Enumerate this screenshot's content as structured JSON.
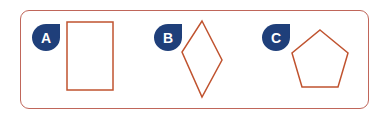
{
  "options": [
    {
      "label": "A",
      "shape": "rectangle"
    },
    {
      "label": "B",
      "shape": "rhombus"
    },
    {
      "label": "C",
      "shape": "pentagon"
    }
  ],
  "colors": {
    "frame": "#c0665a",
    "shape_stroke": "#c0532f",
    "badge_fill": "#1f3f7a",
    "badge_text": "#ffffff"
  }
}
